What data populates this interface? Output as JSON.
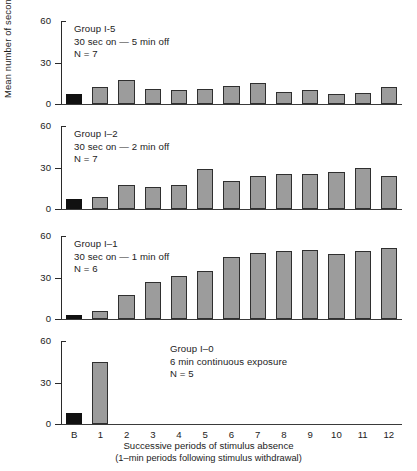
{
  "chart_data": {
    "type": "bar",
    "title": "",
    "xlabel": "Successive periods of stimulus absence",
    "xlabel_sub": "(1–min periods following stimulus withdrawal)",
    "ylabel": "Mean number of seconds distress crying",
    "ylim": [
      0,
      60
    ],
    "yticks": [
      0,
      30,
      60
    ],
    "grid": false,
    "legend": "none",
    "categories": [
      "B",
      "1",
      "2",
      "3",
      "4",
      "5",
      "6",
      "7",
      "8",
      "9",
      "10",
      "11",
      "12"
    ],
    "baseline_category": "B",
    "colors": {
      "baseline_bar": "#111111",
      "period_bar": "#9c9c9c",
      "bar_outline": "#2f2f2f",
      "axis": "#2a2a2a",
      "text": "#1c1c1c",
      "background": "#ffffff"
    },
    "panels": [
      {
        "id": "group-i-5",
        "annotation": [
          "Group I-5",
          "30 sec on — 5 min off",
          "N = 7"
        ],
        "values": [
          7,
          12,
          17,
          11,
          10,
          11,
          13,
          15,
          9,
          10,
          7,
          8,
          12
        ]
      },
      {
        "id": "group-i-2",
        "annotation": [
          "Group I–2",
          "30 sec on — 2 min off",
          "N = 7"
        ],
        "values": [
          7,
          9,
          17,
          16,
          17,
          29,
          20,
          24,
          25,
          25,
          27,
          30,
          24
        ]
      },
      {
        "id": "group-i-1",
        "annotation": [
          "Group I–1",
          "30 sec on — 1 min off",
          "N = 6"
        ],
        "values": [
          3,
          6,
          17,
          27,
          31,
          35,
          45,
          48,
          49,
          50,
          47,
          49,
          51
        ]
      },
      {
        "id": "group-i-0",
        "annotation": [
          "Group I–0",
          "6 min continuous exposure",
          "N = 5"
        ],
        "values": [
          8,
          45,
          0,
          0,
          0,
          0,
          0,
          0,
          0,
          0,
          0,
          0,
          0
        ]
      }
    ]
  }
}
